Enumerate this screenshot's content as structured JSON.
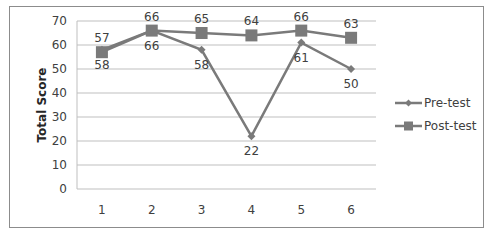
{
  "chart_data": {
    "type": "line",
    "title": "",
    "xlabel": "",
    "ylabel": "Total Score",
    "ylim": [
      0,
      70
    ],
    "yticks": [
      0,
      10,
      20,
      30,
      40,
      50,
      60,
      70
    ],
    "categories": [
      "1",
      "2",
      "3",
      "4",
      "5",
      "6"
    ],
    "grid": true,
    "legend_position": "right",
    "series": [
      {
        "name": "Pre-test",
        "marker": "diamond",
        "values": [
          58,
          66,
          58,
          22,
          61,
          50
        ],
        "label_position": "below"
      },
      {
        "name": "Post-test",
        "marker": "square",
        "values": [
          57,
          66,
          65,
          64,
          66,
          63
        ],
        "label_position": "above"
      }
    ],
    "colors": {
      "line": "#7a7a7a",
      "grid": "#bfbfbf",
      "text": "#404040"
    }
  }
}
